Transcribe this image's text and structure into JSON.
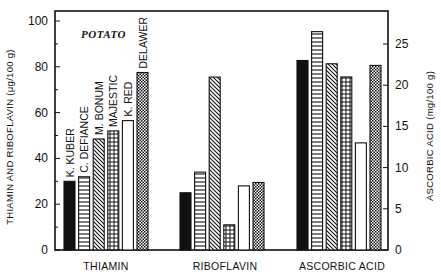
{
  "chart_data": {
    "type": "bar",
    "title": "POTATO",
    "categories": [
      "THIAMIN",
      "RIBOFLAVIN",
      "ASCORBIC ACID"
    ],
    "series": [
      {
        "name": "K. KUBER",
        "pattern": "solid-black",
        "values": [
          30,
          25,
          23.0
        ]
      },
      {
        "name": "C. DEFIANCE",
        "pattern": "horizontal-lines",
        "values": [
          32,
          34,
          26.5
        ]
      },
      {
        "name": "M. BONUM",
        "pattern": "diagonal-lines",
        "values": [
          48.5,
          75.5,
          22.6
        ]
      },
      {
        "name": "MAJESTIC",
        "pattern": "grid",
        "values": [
          52,
          11,
          21.0
        ]
      },
      {
        "name": "K. RED",
        "pattern": "white",
        "values": [
          56.5,
          28,
          13.0
        ]
      },
      {
        "name": "DELAWER",
        "pattern": "checkered",
        "values": [
          77.5,
          29.5,
          22.4
        ]
      }
    ],
    "ylabel": "THIAMIN AND RIBOFLAVIN (μg/100 g)",
    "ylim": [
      0,
      100
    ],
    "yticks": [
      "0",
      "20",
      "40",
      "60",
      "80",
      "100"
    ],
    "y2label": "ASCORBIC ACID (mg/100 g)",
    "y2lim": [
      0,
      25
    ],
    "y2ticks": [
      "0",
      "5",
      "10",
      "15",
      "20",
      "25"
    ],
    "axis_for_category": {
      "THIAMIN": "left",
      "RIBOFLAVIN": "left",
      "ASCORBIC ACID": "right"
    },
    "grid": false,
    "legend_position": "bar labels above thiamin bars"
  },
  "labels": {
    "title": "POTATO",
    "ylabel": "THIAMIN AND RIBOFLAVIN (μg/100 g)",
    "y2label": "ASCORBIC ACID (mg/100 g)",
    "group0": "THIAMIN",
    "group1": "RIBOFLAVIN",
    "group2": "ASCORBIC ACID",
    "bar0": "K. KUBER",
    "bar1": "C. DEFIANCE",
    "bar2": "M. BONUM",
    "bar3": "MAJESTIC",
    "bar4": "K. RED",
    "bar5": "DELAWER",
    "yt0": "0",
    "yt1": "20",
    "yt2": "40",
    "yt3": "60",
    "yt4": "80",
    "yt5": "100",
    "y2t0": "0",
    "y2t1": "5",
    "y2t2": "10",
    "y2t3": "15",
    "y2t4": "20",
    "y2t5": "25"
  }
}
